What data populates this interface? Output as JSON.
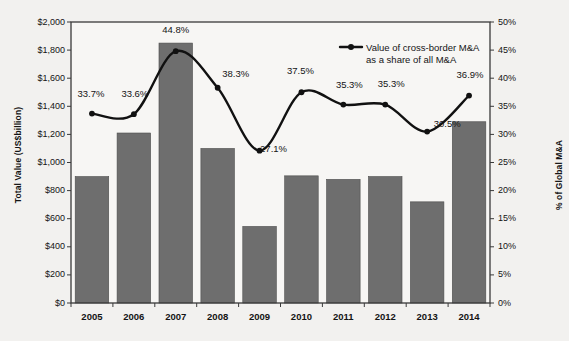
{
  "chart_data": {
    "type": "bar",
    "title": "",
    "subtitle": "",
    "categories": [
      "2005",
      "2006",
      "2007",
      "2008",
      "2009",
      "2010",
      "2011",
      "2012",
      "2013",
      "2014"
    ],
    "xlabel": "",
    "ylabel": "Total Value (US$billion)",
    "ylabel_right": "% of Global M&A",
    "ylim": [
      0,
      2000
    ],
    "ylim_right": [
      0,
      50
    ],
    "grid": false,
    "legend_position": "inside-top-right",
    "series": [
      {
        "name": "Total Value (US$billion)",
        "type": "bar",
        "axis": "left",
        "color": "#6e6e6e",
        "values": [
          900,
          1210,
          1850,
          1100,
          545,
          905,
          880,
          900,
          720,
          1290
        ]
      },
      {
        "name": "Value of cross-border M&A as a share of all M&A",
        "type": "line",
        "axis": "right",
        "color": "#111111",
        "values": [
          33.7,
          33.6,
          44.8,
          38.3,
          27.1,
          37.5,
          35.3,
          35.3,
          30.5,
          36.9
        ],
        "data_labels": [
          "33.7%",
          "33.6%",
          "44.8%",
          "38.3%",
          "27.1%",
          "37.5%",
          "35.3%",
          "35.3%",
          "30.5%",
          "36.9%"
        ]
      }
    ],
    "yticks_left": [
      "$0",
      "$200",
      "$400",
      "$600",
      "$800",
      "$1,000",
      "$1,200",
      "$1,400",
      "$1,600",
      "$1,800",
      "$2,000"
    ],
    "ytick_values_left": [
      0,
      200,
      400,
      600,
      800,
      1000,
      1200,
      1400,
      1600,
      1800,
      2000
    ],
    "yticks_right": [
      "0%",
      "5%",
      "10%",
      "15%",
      "20%",
      "25%",
      "30%",
      "35%",
      "40%",
      "45%",
      "50%"
    ],
    "ytick_values_right": [
      0,
      5,
      10,
      15,
      20,
      25,
      30,
      35,
      40,
      45,
      50
    ]
  },
  "legend": {
    "line1": "Value of cross-border M&A",
    "line2": "as a share of all M&A"
  },
  "colors": {
    "bar": "#6e6e6e",
    "line": "#111111",
    "background": "#f2f1ef",
    "plot_background": "#f7f6f4",
    "axis": "#3a3a3a",
    "text": "#141414"
  }
}
